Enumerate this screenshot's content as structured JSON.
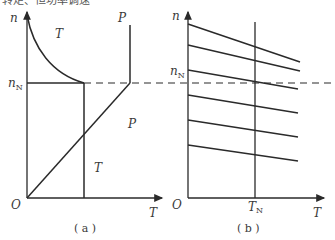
{
  "top_cut_text": "转矩、恒功率调速",
  "panel_a": {
    "y_axis_label": "n",
    "x_axis_label": "T",
    "origin_label": "O",
    "rated_speed_label": "n",
    "rated_speed_subscript": "N",
    "torque_region_label_upper": "T",
    "power_label_upper": "P",
    "power_label_lower": "P",
    "torque_label_lower": "T",
    "caption": "( a )"
  },
  "panel_b": {
    "y_axis_label": "n",
    "x_axis_label": "T",
    "origin_label": "O",
    "rated_speed_label": "n",
    "rated_speed_subscript": "N",
    "rated_torque_label": "T",
    "rated_torque_subscript": "N",
    "caption": "( b )",
    "characteristic_lines": [
      {
        "x1": 188,
        "y1": 24,
        "x2": 300,
        "y2": 62
      },
      {
        "x1": 188,
        "y1": 45,
        "x2": 300,
        "y2": 71
      },
      {
        "x1": 188,
        "y1": 70,
        "x2": 298,
        "y2": 89
      },
      {
        "x1": 188,
        "y1": 95,
        "x2": 298,
        "y2": 113
      },
      {
        "x1": 188,
        "y1": 120,
        "x2": 298,
        "y2": 137
      },
      {
        "x1": 188,
        "y1": 145,
        "x2": 298,
        "y2": 161
      }
    ]
  }
}
